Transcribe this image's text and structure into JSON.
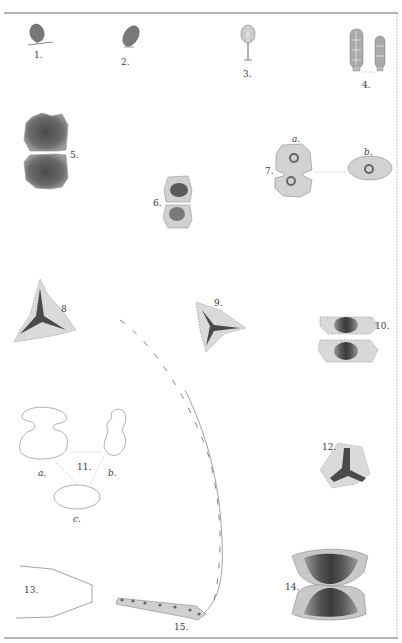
{
  "plate": {
    "colors": {
      "paper": "#ffffff",
      "ink": "#3a3a3a",
      "rule": "#6a6a6a",
      "dark_fill": "#5a5a5a",
      "mid_fill": "#8c8c8c",
      "light_fill": "#d8d8d8",
      "outline": "#9a9a9a"
    },
    "figures": [
      {
        "id": "1",
        "label": "1."
      },
      {
        "id": "2",
        "label": "2."
      },
      {
        "id": "3",
        "label": "3."
      },
      {
        "id": "4",
        "label": "4."
      },
      {
        "id": "5",
        "label": "5."
      },
      {
        "id": "6",
        "label": "6."
      },
      {
        "id": "7",
        "label": "7.",
        "parts": [
          "a.",
          "b."
        ]
      },
      {
        "id": "8",
        "label": "8"
      },
      {
        "id": "9",
        "label": "9."
      },
      {
        "id": "10",
        "label": "10."
      },
      {
        "id": "11",
        "label": "11.",
        "parts": [
          "a.",
          "b.",
          "c."
        ]
      },
      {
        "id": "12",
        "label": "12."
      },
      {
        "id": "13",
        "label": "13."
      },
      {
        "id": "14",
        "label": "14."
      },
      {
        "id": "15",
        "label": "15."
      }
    ]
  }
}
